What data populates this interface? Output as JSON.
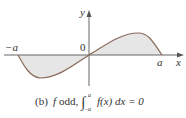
{
  "figure": {
    "axes": {
      "x_label": "x",
      "y_label": "y",
      "origin_label": "0",
      "left_label": "−a",
      "right_label": "a"
    },
    "caption": {
      "prefix": "(b)",
      "f": "f",
      "text": "odd,",
      "upper": "a",
      "lower": "−a",
      "integrand": "f(x) dx = 0"
    },
    "colors": {
      "fill": "#e6e6e6",
      "curve": "#8a6a5a",
      "axis": "#555555"
    }
  }
}
